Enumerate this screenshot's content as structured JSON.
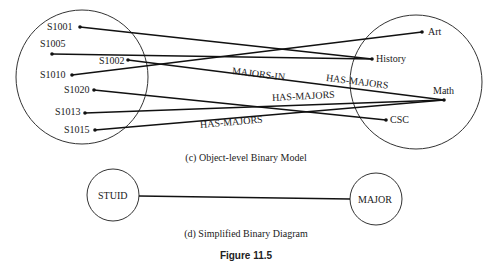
{
  "object_level_model": {
    "caption": "(c) Object-level Binary Model",
    "left_set": {
      "name": "students",
      "items": [
        {
          "id": "S1001"
        },
        {
          "id": "S1005"
        },
        {
          "id": "S1002"
        },
        {
          "id": "S1010"
        },
        {
          "id": "S1020"
        },
        {
          "id": "S1013"
        },
        {
          "id": "S1015"
        }
      ]
    },
    "right_set": {
      "name": "majors",
      "items": [
        {
          "id": "Art"
        },
        {
          "id": "History"
        },
        {
          "id": "Math"
        },
        {
          "id": "CSC"
        }
      ]
    },
    "links": [
      {
        "from": "S1001",
        "to": "History"
      },
      {
        "from": "S1005",
        "to": "History"
      },
      {
        "from": "S1010",
        "to": "Art"
      },
      {
        "from": "S1002",
        "to": "Math"
      },
      {
        "from": "S1020",
        "to": "CSC"
      },
      {
        "from": "S1013",
        "to": "Math"
      },
      {
        "from": "S1015",
        "to": "Math"
      }
    ],
    "relation_labels": [
      "MAJORS-IN",
      "HAS-MAJORS",
      "HAS-MAJORS",
      "HAS-MAJORS"
    ]
  },
  "simplified_diagram": {
    "caption": "(d) Simplified Binary Diagram",
    "left_node": "STUID",
    "right_node": "MAJOR"
  },
  "figure_label": "Figure  11.5"
}
